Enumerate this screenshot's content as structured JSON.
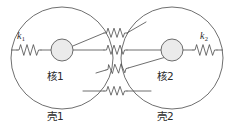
{
  "figure": {
    "background_color": "#ffffff",
    "line_color": "#4a4a4a",
    "core_fill_color": "#ebebeb",
    "text_color": "#2b2b2b"
  },
  "units": [
    {
      "id": "unit-1",
      "shell_label": "壳1",
      "core_label": "核1",
      "internal_spring_label_base": "k",
      "internal_spring_label_sub": "1",
      "internal_spring_label": "k1",
      "shell_center_x": 62,
      "shell_center_y": 58,
      "shell_radius": 51,
      "core_center_x": 62,
      "core_center_y": 50,
      "core_radius": 11
    },
    {
      "id": "unit-2",
      "shell_label": "壳2",
      "core_label": "核2",
      "internal_spring_label_base": "k",
      "internal_spring_label_sub": "2",
      "internal_spring_label": "k2",
      "shell_center_x": 172,
      "shell_center_y": 58,
      "shell_radius": 51,
      "core_center_x": 172,
      "core_center_y": 50,
      "core_radius": 11
    }
  ],
  "coupling_springs": [
    {
      "id": "coupling-core1-shell2",
      "from": "核1",
      "to": "壳2",
      "position": "top"
    },
    {
      "id": "coupling-core1-core2",
      "from": "核1",
      "to": "核2",
      "position": "middle"
    },
    {
      "id": "coupling-shell1-core2",
      "from": "壳1",
      "to": "核2",
      "position": "lower"
    },
    {
      "id": "coupling-shell1-shell2",
      "from": "壳1",
      "to": "壳2",
      "position": "bottom"
    }
  ],
  "internal_springs": [
    {
      "id": "spring-k1",
      "connects": [
        "壳1",
        "核1"
      ],
      "label": "k1"
    },
    {
      "id": "spring-k2",
      "connects": [
        "核2",
        "壳2"
      ],
      "label": "k2"
    }
  ],
  "labels": {
    "shell_1": "壳1",
    "shell_2": "壳2",
    "core_1": "核1",
    "core_2": "核2",
    "k1_base": "k",
    "k1_sub": "1",
    "k2_base": "k",
    "k2_sub": "2"
  }
}
